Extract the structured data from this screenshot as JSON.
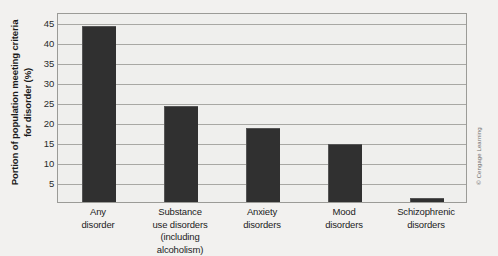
{
  "chart_data": {
    "type": "bar",
    "title": "",
    "xlabel": "",
    "ylabel": "Portion of population meeting criteria for disorder (%)",
    "ylabel_line1": "Portion of population meeting criteria",
    "ylabel_line2": "for disorder (%)",
    "ylim": [
      0,
      47.5
    ],
    "yticks": [
      5,
      10,
      15,
      20,
      25,
      30,
      35,
      40,
      45
    ],
    "ytick_labels": [
      "5",
      "10",
      "15",
      "20",
      "25",
      "30",
      "35",
      "40",
      "45"
    ],
    "grid": true,
    "grid_axis": "y",
    "legend": "none",
    "categories": [
      "Any disorder",
      "Substance use disorders (including alcoholism)",
      "Anxiety disorders",
      "Mood disorders",
      "Schizophrenic disorders"
    ],
    "category_lines": [
      [
        "Any",
        "disorder"
      ],
      [
        "Substance",
        "use disorders",
        "(including alcoholism)"
      ],
      [
        "Anxiety",
        "disorders"
      ],
      [
        "Mood",
        "disorders"
      ],
      [
        "Schizophrenic",
        "disorders"
      ]
    ],
    "values": [
      44,
      24,
      18.5,
      14.5,
      1
    ],
    "bar_color": "#303030",
    "plot_background": "#efefed",
    "gridline_color": "#a8a8a4",
    "axis_border_color": "#9b9b97"
  },
  "credit": {
    "text": "© Cengage Learning"
  }
}
